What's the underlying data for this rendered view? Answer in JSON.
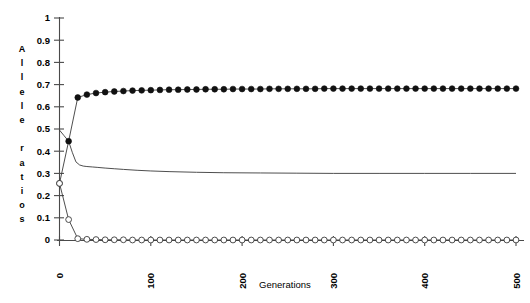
{
  "chart_data": {
    "type": "line",
    "title": "",
    "xlabel": "Generations",
    "ylabel": "Allele ratios",
    "ylabel_letters": [
      "A",
      "l",
      "l",
      "e",
      "l",
      "e",
      "",
      "r",
      "a",
      "t",
      "i",
      "o",
      "s"
    ],
    "xlim": [
      0,
      500
    ],
    "ylim": [
      0,
      1
    ],
    "grid": false,
    "legend": "none",
    "x_ticks": [
      0,
      100,
      200,
      300,
      400,
      500
    ],
    "x_tick_labels": [
      "0",
      "100",
      "200",
      "300",
      "400",
      "500"
    ],
    "x_tick_rotation": -90,
    "y_ticks": [
      0,
      0.1,
      0.2,
      0.3,
      0.4,
      0.5,
      0.6,
      0.7,
      0.8,
      0.9,
      1
    ],
    "y_tick_labels": [
      "0",
      "0.1",
      "0.2",
      "0.3",
      "0.4",
      "0.5",
      "0.6",
      "0.7",
      "0.8",
      "0.9",
      "1"
    ],
    "colors": {
      "line": "#3a3a3a",
      "filled_marker": "#111111",
      "open_marker_fill": "#ffffff",
      "axis": "#4a4a4a"
    },
    "series": [
      {
        "name": "filled-circle-series",
        "marker": "filled-circle",
        "x": [
          0,
          10,
          20,
          30,
          40,
          50,
          60,
          70,
          80,
          90,
          100,
          110,
          120,
          130,
          140,
          150,
          160,
          170,
          180,
          190,
          200,
          210,
          220,
          230,
          240,
          250,
          260,
          270,
          280,
          290,
          300,
          310,
          320,
          330,
          340,
          350,
          360,
          370,
          380,
          390,
          400,
          410,
          420,
          430,
          440,
          450,
          460,
          470,
          480,
          490,
          500
        ],
        "values": [
          0.255,
          0.445,
          0.642,
          0.655,
          0.662,
          0.666,
          0.669,
          0.671,
          0.673,
          0.674,
          0.675,
          0.676,
          0.677,
          0.677,
          0.678,
          0.678,
          0.679,
          0.679,
          0.679,
          0.68,
          0.68,
          0.68,
          0.68,
          0.681,
          0.681,
          0.681,
          0.681,
          0.681,
          0.681,
          0.682,
          0.682,
          0.682,
          0.682,
          0.682,
          0.682,
          0.682,
          0.682,
          0.682,
          0.682,
          0.682,
          0.682,
          0.682,
          0.682,
          0.682,
          0.682,
          0.682,
          0.682,
          0.682,
          0.682,
          0.682,
          0.682
        ]
      },
      {
        "name": "open-circle-series",
        "marker": "open-circle",
        "x": [
          0,
          10,
          20,
          30,
          40,
          50,
          60,
          70,
          80,
          90,
          100,
          110,
          120,
          130,
          140,
          150,
          160,
          170,
          180,
          190,
          200,
          210,
          220,
          230,
          240,
          250,
          260,
          270,
          280,
          290,
          300,
          310,
          320,
          330,
          340,
          350,
          360,
          370,
          380,
          390,
          400,
          410,
          420,
          430,
          440,
          450,
          460,
          470,
          480,
          490,
          500
        ],
        "values": [
          0.255,
          0.092,
          0.006,
          0.003,
          0.002,
          0.001,
          0.001,
          0.001,
          0.0,
          0.0,
          0.0,
          0.0,
          0.0,
          0.0,
          0.0,
          0.0,
          0.0,
          0.0,
          0.0,
          0.0,
          0.0,
          0.0,
          0.0,
          0.0,
          0.0,
          0.0,
          0.0,
          0.0,
          0.0,
          0.0,
          0.0,
          0.0,
          0.0,
          0.0,
          0.0,
          0.0,
          0.0,
          0.0,
          0.0,
          0.0,
          0.0,
          0.0,
          0.0,
          0.0,
          0.0,
          0.0,
          0.0,
          0.0,
          0.0,
          0.0,
          0.0
        ]
      },
      {
        "name": "plain-line-series",
        "marker": "none",
        "x": [
          0,
          5,
          10,
          14,
          18,
          22,
          26,
          30,
          36,
          42,
          50,
          60,
          70,
          85,
          100,
          120,
          150,
          180,
          220,
          260,
          300,
          350,
          400,
          450,
          500
        ],
        "values": [
          0.495,
          0.47,
          0.445,
          0.395,
          0.352,
          0.338,
          0.333,
          0.331,
          0.329,
          0.327,
          0.324,
          0.321,
          0.318,
          0.314,
          0.311,
          0.308,
          0.305,
          0.303,
          0.302,
          0.301,
          0.3,
          0.3,
          0.3,
          0.3,
          0.3
        ]
      }
    ]
  }
}
